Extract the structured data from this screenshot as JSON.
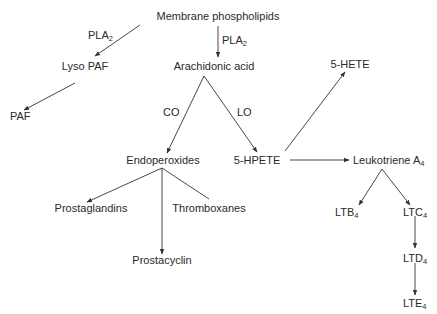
{
  "diagram": {
    "type": "metabolic-pathway",
    "nodes": {
      "membrane_phospholipids": "Membrane phospholipids",
      "lyso_paf": "Lyso PAF",
      "paf": "PAF",
      "arachidonic_acid": "Arachidonic acid",
      "endoperoxides": "Endoperoxides",
      "prostaglandins": "Prostaglandins",
      "thromboxanes": "Thromboxanes",
      "prostacyclin": "Prostacyclin",
      "hpete_5": "5-HPETE",
      "hete_5": "5-HETE",
      "leukotriene_a4": {
        "base": "Leukotriene A",
        "sub": "4"
      },
      "ltb4": {
        "base": "LTB",
        "sub": "4"
      },
      "ltc4": {
        "base": "LTC",
        "sub": "4"
      },
      "ltd4": {
        "base": "LTD",
        "sub": "4"
      },
      "lte4": {
        "base": "LTE",
        "sub": "4"
      }
    },
    "edge_labels": {
      "pla2_left": {
        "base": "PLA",
        "sub": "2"
      },
      "pla2_down": {
        "base": "PLA",
        "sub": "2"
      },
      "co": "CO",
      "lo": "LO"
    },
    "edges": [
      {
        "from": "Membrane phospholipids",
        "to": "Lyso PAF",
        "label": "PLA2"
      },
      {
        "from": "Membrane phospholipids",
        "to": "Arachidonic acid",
        "label": "PLA2"
      },
      {
        "from": "Lyso PAF",
        "to": "PAF"
      },
      {
        "from": "Arachidonic acid",
        "to": "Endoperoxides",
        "label": "CO"
      },
      {
        "from": "Arachidonic acid",
        "to": "5-HPETE",
        "label": "LO"
      },
      {
        "from": "Endoperoxides",
        "to": "Prostaglandins"
      },
      {
        "from": "Endoperoxides",
        "to": "Thromboxanes"
      },
      {
        "from": "Endoperoxides",
        "to": "Prostacyclin"
      },
      {
        "from": "5-HPETE",
        "to": "5-HETE"
      },
      {
        "from": "5-HPETE",
        "to": "Leukotriene A4"
      },
      {
        "from": "Leukotriene A4",
        "to": "LTB4"
      },
      {
        "from": "Leukotriene A4",
        "to": "LTC4"
      },
      {
        "from": "LTC4",
        "to": "LTD4"
      },
      {
        "from": "LTD4",
        "to": "LTE4"
      }
    ],
    "line_color": "#333333",
    "text_color": "#2a2a2a"
  }
}
